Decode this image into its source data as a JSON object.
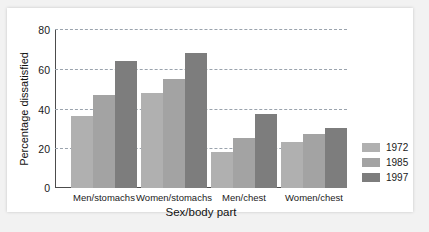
{
  "chart_data": {
    "type": "bar",
    "title": "",
    "xlabel": "Sex/body part",
    "ylabel": "Percentage dissatisfied",
    "categories": [
      "Men/stomachs",
      "Women/stomachs",
      "Men/chest",
      "Women/chest"
    ],
    "series": [
      {
        "name": "1972",
        "color": "#b0b0b0",
        "values": [
          36,
          48,
          18,
          23
        ]
      },
      {
        "name": "1985",
        "color": "#a3a3a3",
        "values": [
          47,
          55,
          25,
          27
        ]
      },
      {
        "name": "1997",
        "color": "#7d7d7d",
        "values": [
          64,
          68,
          37,
          30
        ]
      }
    ],
    "ylim": [
      0,
      80
    ],
    "yticks": [
      0,
      20,
      40,
      60,
      80
    ],
    "ytick_labels": [
      "0",
      "20",
      "40",
      "60",
      "80"
    ],
    "grid": true,
    "grid_style": "dashed",
    "legend_position": "right"
  }
}
